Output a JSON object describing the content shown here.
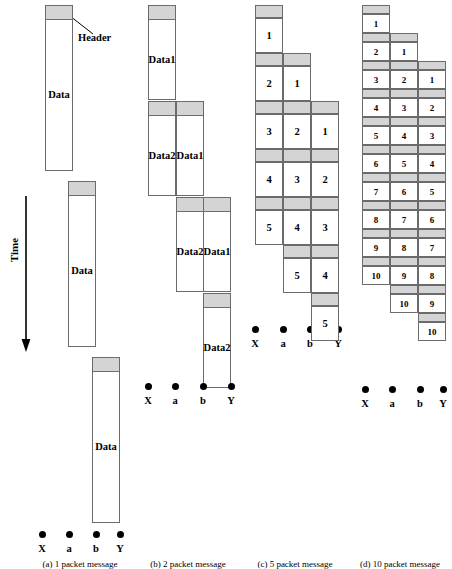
{
  "figure": {
    "annotations": {
      "header_label": "Header",
      "time_label": "Time",
      "data_label": "Data"
    },
    "node_labels": [
      "X",
      "a",
      "b",
      "Y"
    ],
    "colors": {
      "header_fill": "#d4d4d4",
      "body_fill": "#ffffff",
      "stroke": "#6b6b6b",
      "dot": "#000000"
    }
  },
  "panels": [
    {
      "id": "a",
      "caption": "(a) 1 packet message",
      "packet_count": 1,
      "hops": 3,
      "blocks": [
        {
          "label": "Data",
          "hop": 0
        },
        {
          "label": "Data",
          "hop": 1
        },
        {
          "label": "Data",
          "hop": 2
        }
      ]
    },
    {
      "id": "b",
      "caption": "(b) 2 packet message",
      "packet_count": 2,
      "hops": 3,
      "blocks": [
        {
          "label": "Data 1",
          "line1": "Data",
          "line2": "1"
        },
        {
          "label": "Data 2",
          "line1": "Data",
          "line2": "2"
        },
        {
          "label": "Data 1",
          "line1": "Data",
          "line2": "1"
        },
        {
          "label": "Data 2",
          "line1": "Data",
          "line2": "2"
        },
        {
          "label": "Data 1",
          "line1": "Data",
          "line2": "1"
        },
        {
          "label": "Data 2",
          "line1": "Data",
          "line2": "2"
        }
      ]
    },
    {
      "id": "c",
      "caption": "(c) 5 packet message",
      "packet_count": 5,
      "hops": 3,
      "columns": [
        {
          "hop": 0,
          "values": [
            "1",
            "2",
            "3",
            "4",
            "5"
          ]
        },
        {
          "hop": 1,
          "values": [
            "1",
            "2",
            "3",
            "4",
            "5"
          ]
        },
        {
          "hop": 2,
          "values": [
            "1",
            "2",
            "3",
            "4",
            "5"
          ]
        }
      ]
    },
    {
      "id": "d",
      "caption": "(d) 10 packet message",
      "packet_count": 10,
      "hops": 3,
      "columns": [
        {
          "hop": 0,
          "values": [
            "1",
            "2",
            "3",
            "4",
            "5",
            "6",
            "7",
            "8",
            "9",
            "10"
          ]
        },
        {
          "hop": 1,
          "values": [
            "1",
            "2",
            "3",
            "4",
            "5",
            "6",
            "7",
            "8",
            "9",
            "10"
          ]
        },
        {
          "hop": 2,
          "values": [
            "1",
            "2",
            "3",
            "4",
            "5",
            "6",
            "7",
            "8",
            "9",
            "10"
          ]
        }
      ]
    }
  ]
}
